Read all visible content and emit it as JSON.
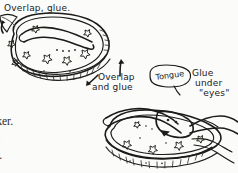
{
  "page": {
    "kind": "hand-drawn craft instruction illustration",
    "background_color": "#fbfbf9",
    "ink_color": "#1b1b19",
    "width": 238,
    "height": 173
  },
  "annotations": {
    "top_label": "Overlap, glue.",
    "middle_label_line1": "Overlap",
    "middle_label_line2": "and glue",
    "tongue_label": "Tongue",
    "glue_label_line1": "Glue",
    "glue_label_line2": "under",
    "glue_label_line3": "\"eyes\""
  },
  "body_text": {
    "lines": [
      "ch",
      "eaker.",
      "the",
      "ow."
    ]
  },
  "figures": [
    {
      "name": "snake-body-top",
      "description": "oval kidney shaped body with star pattern, wavy inner band and tick-marked edge strip"
    },
    {
      "name": "snake-head-bottom",
      "description": "snake head with forked tongue resting on star patterned coil with tick-marked edge strip"
    }
  ],
  "markers": {
    "arrow_left": "arrow-up-left",
    "arrow_right": "arrow-up",
    "arrow_middle": "arrow-up-left"
  }
}
